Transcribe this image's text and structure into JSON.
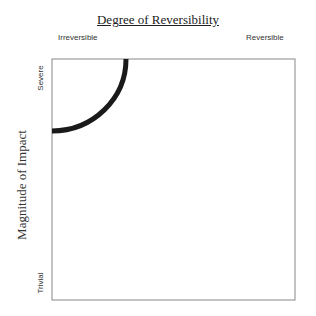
{
  "title": "Degree of Reversibility",
  "x_axis": {
    "left_label": "Irreversible",
    "right_label": "Reversible"
  },
  "y_axis": {
    "title": "Magnitude of Impact",
    "top_label": "Severe",
    "bottom_label": "Trivial"
  },
  "arc": {
    "color": "#1a1a1a",
    "description": "quarter-circle boundary from top edge to left edge, centered at the irreversible/severe corner"
  },
  "box": {
    "border_color": "#888888"
  }
}
